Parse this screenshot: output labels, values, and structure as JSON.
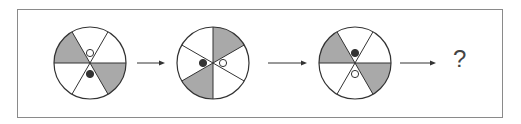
{
  "colors": {
    "shade": "#a9a9a9",
    "line": "#333333",
    "frame": "#8a8a8a"
  },
  "figures": [
    {
      "id": 1,
      "cx": 90,
      "cy": 63,
      "r": 36,
      "spokes_deg": [
        0,
        60,
        120
      ],
      "shaded": [
        [
          120,
          180
        ],
        [
          300,
          360
        ]
      ],
      "dots": [
        {
          "type": "white",
          "dx": 0,
          "dy": -10
        },
        {
          "type": "black",
          "dx": 0,
          "dy": 11
        }
      ]
    },
    {
      "id": 2,
      "cx": 213,
      "cy": 63,
      "r": 36,
      "spokes_deg": [
        90,
        30,
        150
      ],
      "shaded": [
        [
          30,
          90
        ],
        [
          210,
          270
        ]
      ],
      "dots": [
        {
          "type": "black",
          "dx": -10,
          "dy": 0
        },
        {
          "type": "white",
          "dx": 10,
          "dy": 0
        }
      ]
    },
    {
      "id": 3,
      "cx": 355,
      "cy": 63,
      "r": 36,
      "spokes_deg": [
        0,
        60,
        120
      ],
      "shaded": [
        [
          120,
          180
        ],
        [
          300,
          360
        ]
      ],
      "dots": [
        {
          "type": "black",
          "dx": 0,
          "dy": -10
        },
        {
          "type": "white",
          "dx": 0,
          "dy": 11
        }
      ]
    }
  ],
  "arrows": [
    {
      "x1": 137,
      "x2": 165,
      "y": 63
    },
    {
      "x1": 268,
      "x2": 307,
      "y": 63
    },
    {
      "x1": 400,
      "x2": 436,
      "y": 63
    }
  ],
  "question_mark": "?"
}
